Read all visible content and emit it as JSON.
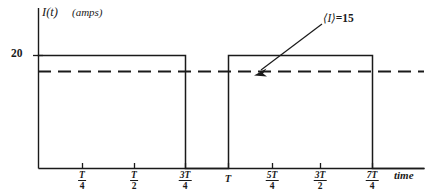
{
  "figure": {
    "axis_title_symbol": "I(t)",
    "axis_title_units": "(amps)",
    "time_axis_label": "time",
    "y_tick_label": "20",
    "annotation": {
      "symbol": "⟨I⟩",
      "equals_value": "=15",
      "full_text": "⟨I⟩=15"
    },
    "line_color": "#1a1a1a",
    "background_color": "#ffffff"
  },
  "chart_data": {
    "type": "line",
    "title": "",
    "subtitle": "",
    "xlabel": "time",
    "ylabel": "I(t)   (amps)",
    "grid": false,
    "legend_position": "none",
    "xlim": [
      0,
      1.92
    ],
    "ylim": [
      0,
      26
    ],
    "x_tick_labels": [
      "T/4",
      "T/2",
      "3T/4",
      "T",
      "5T/4",
      "3T/2",
      "7T/4"
    ],
    "x_tick_values": [
      0.25,
      0.5,
      0.75,
      1.0,
      1.25,
      1.5,
      1.75
    ],
    "y_tick_labels": [
      "20"
    ],
    "y_tick_values": [
      20
    ],
    "series": [
      {
        "name": "I(t)",
        "style": "solid",
        "description": "square wave pulse train, amplitude 20 amps, high for 3/4 of each period then low for 1/4",
        "x": [
          0,
          0.75,
          0.75,
          1.0,
          1.0,
          1.75,
          1.75,
          1.92
        ],
        "values": [
          20,
          20,
          0,
          0,
          20,
          20,
          0,
          0
        ]
      },
      {
        "name": "⟨I⟩ mean current",
        "style": "dashed",
        "description": "horizontal dashed line at the time-averaged current",
        "x": [
          0,
          1.92
        ],
        "values": [
          15,
          15
        ]
      }
    ],
    "annotations": [
      {
        "text": "⟨I⟩=15",
        "points_to_x": 1.0,
        "points_to_y": 15,
        "arrow": true
      }
    ]
  },
  "ticks": [
    {
      "name": "t-quarter",
      "num": "T",
      "den": "4",
      "x": 82
    },
    {
      "name": "t-half",
      "num": "T",
      "den": "2",
      "x": 134
    },
    {
      "name": "three-t-quarters",
      "num": "3T",
      "den": "4",
      "x": 185
    },
    {
      "name": "t-period",
      "plain": "T",
      "x": 228
    },
    {
      "name": "five-t-quarters",
      "num": "5T",
      "den": "4",
      "x": 272
    },
    {
      "name": "three-t-halves",
      "num": "3T",
      "den": "2",
      "x": 320
    },
    {
      "name": "seven-t-quarters",
      "num": "7T",
      "den": "4",
      "x": 372
    }
  ]
}
